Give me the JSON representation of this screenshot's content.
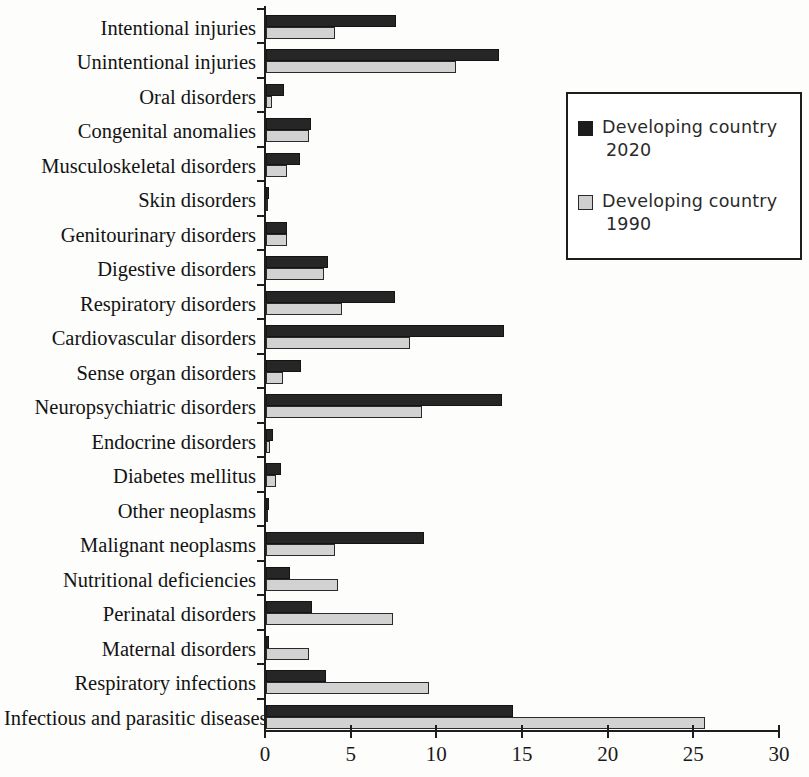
{
  "chart_data": {
    "type": "bar",
    "orientation": "horizontal",
    "title": "",
    "subtitle": "",
    "xlabel": "",
    "ylabel": "",
    "xlim": [
      0,
      30
    ],
    "xticks": [
      0,
      5,
      10,
      15,
      20,
      25,
      30
    ],
    "xtick_labels": [
      "0",
      "5",
      "10",
      "15",
      "20",
      "25",
      "30"
    ],
    "grid": false,
    "legend_position": "upper right",
    "categories": [
      "Intentional injuries",
      "Unintentional injuries",
      "Oral disorders",
      "Congenital anomalies",
      "Musculoskeletal disorders",
      "Skin disorders",
      "Genitourinary disorders",
      "Digestive disorders",
      "Respiratory disorders",
      "Cardiovascular disorders",
      "Sense organ disorders",
      "Neuropsychiatric disorders",
      "Endocrine disorders",
      "Diabetes mellitus",
      "Other neoplasms",
      "Malignant neoplasms",
      "Nutritional deficiencies",
      "Perinatal disorders",
      "Maternal disorders",
      "Respiratory infections",
      "Infectious and parasitic diseases"
    ],
    "series": [
      {
        "name": "Developing country 2020",
        "color": "#262626",
        "values": [
          7.6,
          13.6,
          1.05,
          2.6,
          2.0,
          0.15,
          1.2,
          3.6,
          7.5,
          13.9,
          2.05,
          13.8,
          0.4,
          0.9,
          0.2,
          9.2,
          1.4,
          2.7,
          0.2,
          3.5,
          14.4
        ]
      },
      {
        "name": "Developing country 1990",
        "color": "#d2d2d2",
        "values": [
          4.0,
          11.1,
          0.35,
          2.5,
          1.2,
          0.1,
          1.2,
          3.4,
          4.45,
          8.4,
          1.0,
          9.1,
          0.25,
          0.6,
          0.05,
          4.0,
          4.2,
          7.4,
          2.5,
          9.5,
          25.6
        ]
      }
    ]
  },
  "legend": {
    "entries": [
      {
        "line1": "Developing country",
        "line2": "2020",
        "swatch": "black"
      },
      {
        "line1": "Developing country",
        "line2": "1990",
        "swatch": "gray"
      }
    ]
  }
}
